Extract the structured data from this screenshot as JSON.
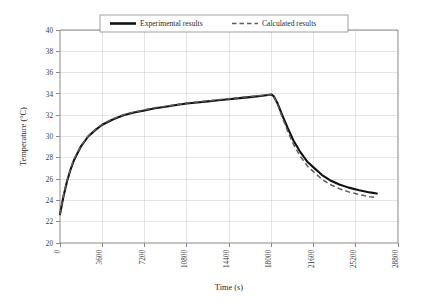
{
  "chart_data": {
    "type": "line",
    "title": "",
    "xlabel": "Time (s)",
    "ylabel": "Temperature (°C)",
    "xlim": [
      0,
      28800
    ],
    "ylim": [
      20,
      40
    ],
    "xticks": [
      0,
      3600,
      7200,
      10800,
      14400,
      18000,
      21600,
      25200,
      28800
    ],
    "xtick_labels": [
      "0",
      "3600",
      "7200",
      "10800",
      "14400",
      "18000",
      "21600",
      "25200",
      "28800"
    ],
    "yticks": [
      20,
      22,
      24,
      26,
      28,
      30,
      32,
      34,
      36,
      38,
      40
    ],
    "ytick_labels": [
      "20",
      "22",
      "24",
      "26",
      "28",
      "30",
      "32",
      "34",
      "36",
      "38",
      "40"
    ],
    "grid": true,
    "legend_position": "top-center",
    "series": [
      {
        "name": "Experimental results",
        "style": "solid",
        "color": "#111111",
        "x": [
          0,
          300,
          600,
          900,
          1200,
          1800,
          2400,
          3000,
          3600,
          4500,
          5400,
          6300,
          7200,
          8100,
          9000,
          9900,
          10800,
          11700,
          12600,
          13500,
          14400,
          15300,
          16200,
          17100,
          17700,
          18000,
          18200,
          18500,
          18900,
          19400,
          19900,
          20500,
          21100,
          21600,
          22300,
          23000,
          23800,
          24600,
          25500,
          26400,
          27000
        ],
        "y": [
          22.7,
          24.4,
          25.8,
          26.9,
          27.8,
          29.1,
          30.0,
          30.6,
          31.1,
          31.6,
          32.0,
          32.25,
          32.45,
          32.65,
          32.8,
          32.95,
          33.1,
          33.2,
          33.3,
          33.4,
          33.5,
          33.6,
          33.7,
          33.8,
          33.9,
          33.95,
          33.8,
          33.2,
          32.1,
          30.8,
          29.6,
          28.5,
          27.6,
          27.1,
          26.4,
          25.9,
          25.5,
          25.2,
          24.95,
          24.75,
          24.65
        ]
      },
      {
        "name": "Calculated results",
        "style": "dashed",
        "color": "#5d5d5d",
        "x": [
          0,
          300,
          600,
          900,
          1200,
          1800,
          2400,
          3000,
          3600,
          4500,
          5400,
          6300,
          7200,
          8100,
          9000,
          9900,
          10800,
          11700,
          12600,
          13500,
          14400,
          15300,
          16200,
          17100,
          17700,
          18000,
          18200,
          18500,
          18900,
          19400,
          19900,
          20500,
          21100,
          21600,
          22300,
          23000,
          23800,
          24600,
          25500,
          26400,
          27000
        ],
        "y": [
          22.7,
          24.5,
          25.9,
          27.0,
          27.9,
          29.15,
          30.05,
          30.65,
          31.15,
          31.65,
          32.05,
          32.3,
          32.5,
          32.7,
          32.85,
          33.0,
          33.15,
          33.25,
          33.35,
          33.45,
          33.55,
          33.65,
          33.75,
          33.85,
          33.92,
          33.95,
          33.75,
          33.1,
          31.9,
          30.5,
          29.25,
          28.1,
          27.2,
          26.7,
          26.0,
          25.5,
          25.1,
          24.8,
          24.55,
          24.35,
          24.25
        ]
      }
    ]
  },
  "legend": {
    "items": [
      {
        "label": "Experimental results",
        "style": "solid"
      },
      {
        "label": "Calculated results",
        "style": "dashed"
      }
    ]
  }
}
